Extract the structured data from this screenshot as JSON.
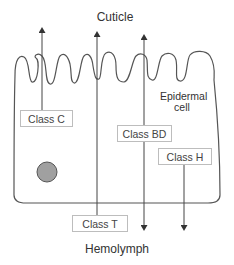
{
  "diagram": {
    "top_label": "Cuticle",
    "bottom_label": "Hemolymph",
    "cell_label_line1": "Epidermal",
    "cell_label_line2": "cell",
    "classes": [
      {
        "id": "C",
        "label": "Class C",
        "direction": "to cuticle"
      },
      {
        "id": "T",
        "label": "Class T",
        "direction": "to cuticle"
      },
      {
        "id": "BD",
        "label": "Class BD",
        "direction": "both (cuticle and hemolymph)"
      },
      {
        "id": "H",
        "label": "Class H",
        "direction": "to hemolymph"
      }
    ],
    "colors": {
      "line": "#444444",
      "box_border": "#bdbdbd",
      "nucleus_fill": "#9e9e9e",
      "text": "#333333"
    }
  }
}
